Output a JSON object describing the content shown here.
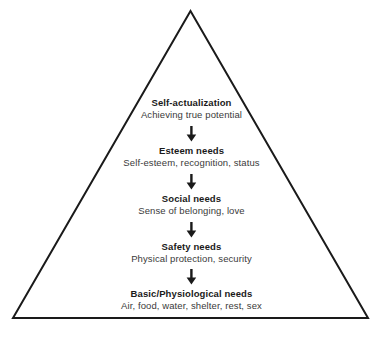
{
  "diagram": {
    "shape": "triangle",
    "outline_color": "#1a1a1a",
    "background_color": "#ffffff",
    "title_color": "#1a1a1a",
    "subtitle_color": "#3a3a3a",
    "arrow_icon_name": "down-arrow-icon",
    "levels": [
      {
        "title": "Self-actualization",
        "subtitle": "Achieving true potential"
      },
      {
        "title": "Esteem needs",
        "subtitle": "Self-esteem, recognition, status"
      },
      {
        "title": "Social needs",
        "subtitle": "Sense of belonging, love"
      },
      {
        "title": "Safety needs",
        "subtitle": "Physical protection, security"
      },
      {
        "title": "Basic/Physiological needs",
        "subtitle": "Air, food, water, shelter, rest, sex"
      }
    ]
  }
}
